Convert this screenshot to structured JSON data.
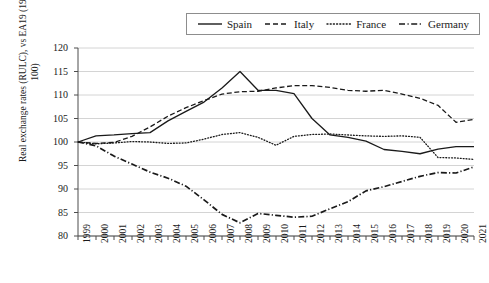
{
  "chart_data": {
    "type": "line",
    "title": "",
    "xlabel": "",
    "ylabel": "Real exchange rates (RULC), vs EA19 (1999 = 100)",
    "ylim": [
      80,
      120
    ],
    "ytick_step": 5,
    "yticks": [
      80,
      85,
      90,
      95,
      100,
      105,
      110,
      115,
      120
    ],
    "grid": true,
    "grid_axis": "y",
    "legend_position": "top-center",
    "x": [
      1999,
      2000,
      2001,
      2002,
      2003,
      2004,
      2005,
      2006,
      2007,
      2008,
      2009,
      2010,
      2011,
      2012,
      2013,
      2014,
      2015,
      2016,
      2017,
      2018,
      2019,
      2020,
      2021
    ],
    "categories": [
      "1999",
      "2000",
      "2001",
      "2002",
      "2003",
      "2004",
      "2005",
      "2006",
      "2007",
      "2008",
      "2009",
      "2010",
      "2011",
      "2012",
      "2013",
      "2014",
      "2015",
      "2016",
      "2017",
      "2018",
      "2019",
      "2020",
      "2021"
    ],
    "series": [
      {
        "name": "Spain",
        "style": "solid",
        "color": "#1a1a1a",
        "values": [
          100.0,
          101.3,
          101.5,
          101.8,
          102.0,
          104.5,
          106.5,
          108.5,
          111.5,
          115.0,
          111.0,
          111.0,
          110.3,
          105.0,
          101.5,
          101.0,
          100.2,
          98.4,
          98.0,
          97.5,
          98.5,
          99.0,
          99.0
        ]
      },
      {
        "name": "Italy",
        "style": "dashed",
        "color": "#1a1a1a",
        "values": [
          100.0,
          99.7,
          99.9,
          101.2,
          103.2,
          105.5,
          107.3,
          108.8,
          110.2,
          110.7,
          110.8,
          111.5,
          112.0,
          112.0,
          111.6,
          111.0,
          110.8,
          111.0,
          110.2,
          109.3,
          107.8,
          104.2,
          104.8
        ]
      },
      {
        "name": "France",
        "style": "dotted",
        "color": "#1a1a1a",
        "values": [
          100.0,
          99.6,
          99.8,
          100.1,
          100.0,
          99.7,
          99.8,
          100.6,
          101.6,
          102.0,
          101.0,
          99.3,
          101.2,
          101.6,
          101.7,
          101.5,
          101.3,
          101.2,
          101.3,
          101.0,
          96.7,
          96.6,
          96.3
        ]
      },
      {
        "name": "Germany",
        "style": "dashdot",
        "color": "#1a1a1a",
        "values": [
          100.0,
          99.2,
          97.0,
          95.3,
          93.6,
          92.3,
          90.6,
          87.7,
          84.6,
          82.8,
          84.8,
          84.4,
          84.0,
          84.2,
          85.8,
          87.3,
          89.6,
          90.5,
          91.6,
          92.7,
          93.5,
          93.4,
          94.7
        ]
      }
    ]
  },
  "legend": {
    "entries": [
      {
        "label": "Spain",
        "icon": "solid-line-icon"
      },
      {
        "label": "Italy",
        "icon": "dashed-line-icon"
      },
      {
        "label": "France",
        "icon": "dotted-line-icon"
      },
      {
        "label": "Germany",
        "icon": "dashdot-line-icon"
      }
    ]
  },
  "colors": {
    "line": "#1a1a1a",
    "grid": "#c9c9c9",
    "axis": "#4d4d4d",
    "background": "#ffffff"
  }
}
